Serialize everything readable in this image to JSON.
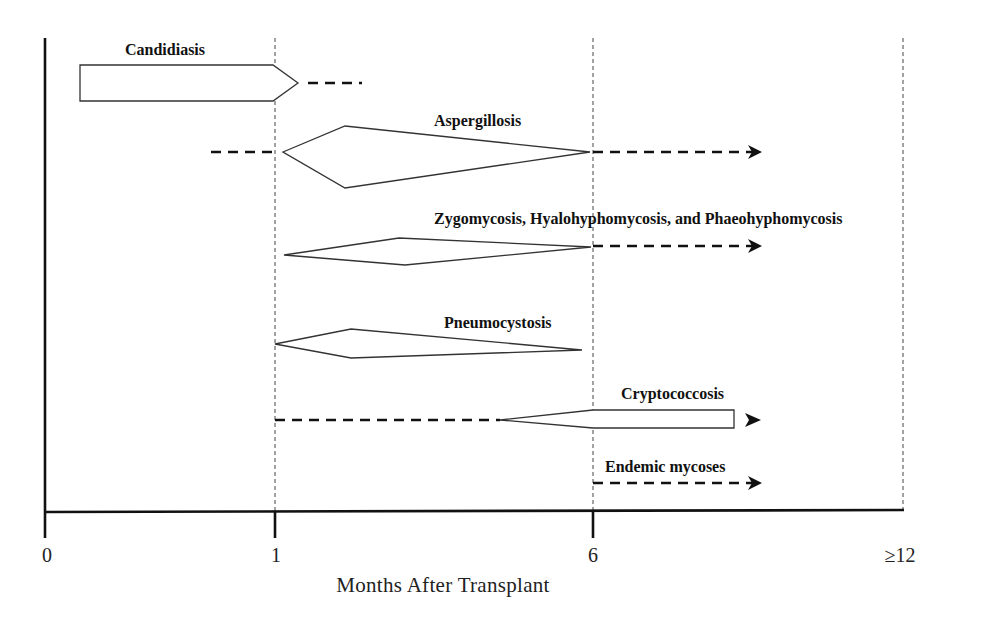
{
  "axis": {
    "title": "Months After Transplant",
    "ticks": [
      {
        "label": "0",
        "x": 47
      },
      {
        "label": "1",
        "x": 275
      },
      {
        "label": "6",
        "x": 593
      },
      {
        "label": "≥12",
        "x": 903
      }
    ]
  },
  "infections": [
    {
      "name": "Candidiasis",
      "shape": "pentagon-arrow",
      "solid_from_month": 0.1,
      "solid_to_month": 1.1,
      "dashed_extension_to_month": 1.5
    },
    {
      "name": "Aspergillosis",
      "shape": "diamond",
      "dashed_before_month": 0.6,
      "solid_from_month": 1,
      "peak_month": 1.5,
      "solid_to_month": 6,
      "dashed_arrow_to_month": "beyond 6"
    },
    {
      "name": "Zygomycosis, Hyalohyphomycosis, and Phaeohyphomycosis",
      "shape": "diamond",
      "solid_from_month": 1,
      "peak_month": 2.5,
      "solid_to_month": 6,
      "dashed_arrow_to_month": "beyond 6"
    },
    {
      "name": "Pneumocystosis",
      "shape": "diamond",
      "solid_from_month": 1,
      "peak_month": 1.5,
      "solid_to_month": 6
    },
    {
      "name": "Cryptococcosis",
      "shape": "wedge-bar",
      "dashed_from_month": 1,
      "solid_from_month": 4,
      "solid_to_month": "beyond 6",
      "dashed_arrow": true
    },
    {
      "name": "Endemic mycoses",
      "shape": "dashed-arrow",
      "dashed_from_month": 6,
      "dashed_arrow": true
    }
  ],
  "labels": {
    "candidiasis": "Candidiasis",
    "aspergillosis": "Aspergillosis",
    "zygomycosis": "Zygomycosis, Hyalohyphomycosis, and Phaeohyphomycosis",
    "pneumocystosis": "Pneumocystosis",
    "cryptococcosis": "Cryptococcosis",
    "endemic": "Endemic mycoses"
  }
}
